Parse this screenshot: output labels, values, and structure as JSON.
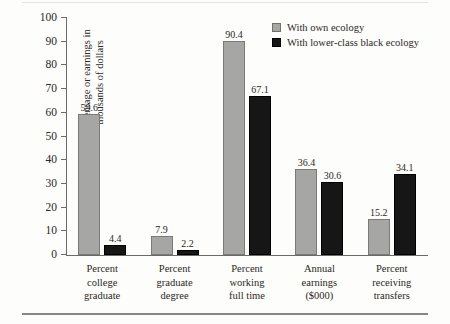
{
  "chart_data": {
    "type": "bar",
    "title": "",
    "xlabel": "",
    "ylabel": "Percentage or earnings in thousands of dollars",
    "ylim": [
      0,
      100
    ],
    "yticks": [
      0,
      10,
      20,
      30,
      40,
      50,
      60,
      70,
      80,
      90,
      100
    ],
    "grid": false,
    "legend_position": "top-right",
    "categories": [
      [
        "Percent",
        "college",
        "graduate"
      ],
      [
        "Percent",
        "graduate",
        "degree"
      ],
      [
        "Percent",
        "working",
        "full time"
      ],
      [
        "Annual",
        "earnings",
        "($000)"
      ],
      [
        "Percent",
        "receiving",
        "transfers"
      ]
    ],
    "series": [
      {
        "name": "With own ecology",
        "color": "#a6a6a4",
        "values": [
          59.6,
          7.9,
          90.4,
          36.4,
          15.2
        ],
        "labels": [
          "59.6",
          "7.9",
          "90.4",
          "36.4",
          "15.2"
        ]
      },
      {
        "name": "With lower-class black ecology",
        "color": "#161616",
        "values": [
          4.4,
          2.2,
          67.1,
          30.6,
          34.1
        ],
        "labels": [
          "4.4",
          "2.2",
          "67.1",
          "30.6",
          "34.1"
        ]
      }
    ]
  }
}
